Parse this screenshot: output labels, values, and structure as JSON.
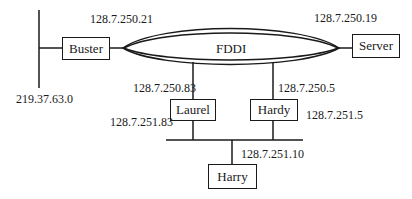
{
  "diagram": {
    "ring": {
      "label": "FDDI"
    },
    "nodes": {
      "buster": {
        "label": "Buster",
        "ring_ip": "128.7.250.21",
        "ext_net": "219.37.63.0"
      },
      "server": {
        "label": "Server",
        "ring_ip": "128.7.250.19"
      },
      "laurel": {
        "label": "Laurel",
        "ring_ip": "128.7.250.83",
        "lan_ip": "128.7.251.83"
      },
      "hardy": {
        "label": "Hardy",
        "ring_ip": "128.7.250.5",
        "lan_ip": "128.7.251.5"
      },
      "harry": {
        "label": "Harry",
        "lan_ip": "128.7.251.10"
      }
    },
    "colors": {
      "line": "#1a1a1a",
      "background": "#ffffff"
    }
  }
}
